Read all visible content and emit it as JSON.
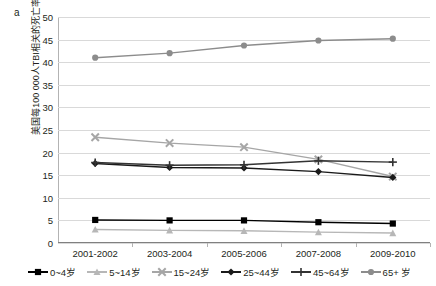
{
  "panel": {
    "label": "a"
  },
  "chart_data": {
    "type": "line",
    "title": "",
    "subtitle": "",
    "xlabel": "",
    "ylabel": "美国每100 000人TBI相关的死亡率",
    "categories": [
      "2001-2002",
      "2003-2004",
      "2005-2006",
      "2007-2008",
      "2009-2010"
    ],
    "ylim": [
      0,
      50
    ],
    "yticks": [
      0,
      5,
      10,
      15,
      20,
      25,
      30,
      35,
      40,
      45,
      50
    ],
    "grid": true,
    "legend_position": "bottom",
    "series": [
      {
        "name": "0~4岁",
        "values": [
          5.1,
          5.0,
          5.0,
          4.6,
          4.3
        ],
        "color": "#000000",
        "marker": "square"
      },
      {
        "name": "5~14岁",
        "values": [
          3.0,
          2.8,
          2.7,
          2.4,
          2.2
        ],
        "color": "#b7b7b7",
        "marker": "triangle"
      },
      {
        "name": "15~24岁",
        "values": [
          23.4,
          22.1,
          21.2,
          18.5,
          14.7
        ],
        "color": "#a6a6a6",
        "marker": "cross-x"
      },
      {
        "name": "25~44岁",
        "values": [
          17.6,
          16.7,
          16.6,
          15.8,
          14.5
        ],
        "color": "#1a1a1a",
        "marker": "diamond"
      },
      {
        "name": "45~64岁",
        "values": [
          17.8,
          17.2,
          17.3,
          18.2,
          17.9
        ],
        "color": "#333333",
        "marker": "plus"
      },
      {
        "name": "65+ 岁",
        "values": [
          41.0,
          42.0,
          43.7,
          44.8,
          45.2
        ],
        "color": "#8c8c8c",
        "marker": "circle"
      }
    ]
  },
  "colors": {
    "grid": "#d9d9d9",
    "axis": "#b3b3b3",
    "text": "#231f20",
    "background": "#ffffff"
  }
}
